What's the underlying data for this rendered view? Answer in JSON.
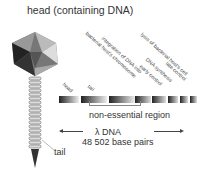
{
  "diagram": {
    "title": "head (containing DNA)",
    "gene_labels": [
      {
        "label": "head"
      },
      {
        "label": "tail"
      },
      {
        "label": "bacterial host's chromosome"
      },
      {
        "label": "integration of DNA into"
      },
      {
        "label": "early control"
      },
      {
        "label": "DNA synthesis"
      },
      {
        "label": "late control"
      },
      {
        "label": "lysis of bacterial host's cell"
      }
    ],
    "region_label": "non-essential region",
    "dna_label": "λ DNA",
    "base_pairs_label": "48 502 base pairs",
    "tail_label": "tail",
    "colors": {
      "segment_dark": "#222222",
      "segment_light": "#dddddd",
      "phage_dark": "#333333",
      "phage_mid": "#888888",
      "phage_light": "#cccccc"
    }
  }
}
